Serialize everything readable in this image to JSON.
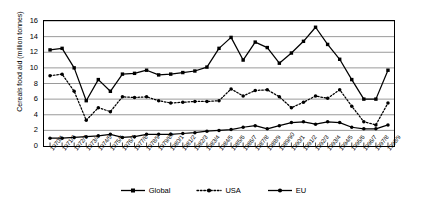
{
  "chart_data": {
    "type": "line",
    "title": "",
    "xlabel": "",
    "ylabel": "Cereals food aid (million tonnes)",
    "ylim": [
      0,
      16
    ],
    "yticks": [
      0,
      2,
      4,
      6,
      8,
      10,
      12,
      14,
      16
    ],
    "grid": true,
    "legend_position": "bottom",
    "categories": [
      "1970/1",
      "1971/2",
      "1972/3",
      "1973/4",
      "1974/5",
      "1975/6",
      "1976/7",
      "1977/8",
      "1978/9",
      "1979/80",
      "1980/1",
      "1981/2",
      "1982/3",
      "1983/4",
      "1984/5",
      "1985/6",
      "1986/7",
      "1987/8",
      "1988/9",
      "1989/90",
      "1990/1",
      "1991/2",
      "1992/3",
      "1993/4",
      "1994/5",
      "1995/6",
      "1996/7",
      "1997/8",
      "1998/9"
    ],
    "series": [
      {
        "name": "Global",
        "color": "#000000",
        "line_style": "solid",
        "marker": "square",
        "values": [
          12.3,
          12.5,
          10.0,
          5.8,
          8.5,
          7.0,
          9.2,
          9.3,
          9.7,
          9.1,
          9.2,
          9.4,
          9.6,
          10.1,
          12.5,
          13.9,
          11.0,
          13.3,
          12.6,
          10.6,
          11.9,
          13.4,
          15.2,
          13.0,
          11.1,
          8.5,
          6.0,
          6.0,
          9.7
        ]
      },
      {
        "name": "USA",
        "color": "#000000",
        "line_style": "dotted",
        "marker": "circle",
        "values": [
          9.0,
          9.2,
          7.0,
          3.3,
          4.9,
          4.4,
          6.3,
          6.2,
          6.3,
          5.8,
          5.5,
          5.6,
          5.7,
          5.7,
          5.8,
          7.3,
          6.4,
          7.1,
          7.2,
          6.3,
          4.9,
          5.6,
          6.4,
          6.1,
          7.2,
          5.1,
          3.1,
          2.7,
          5.5
        ]
      },
      {
        "name": "EU",
        "color": "#000000",
        "line_style": "solid",
        "marker": "circle",
        "values": [
          1.0,
          1.0,
          1.1,
          1.2,
          1.3,
          1.5,
          1.1,
          1.2,
          1.5,
          1.5,
          1.5,
          1.6,
          1.7,
          1.9,
          2.0,
          2.1,
          2.4,
          2.6,
          2.2,
          2.6,
          3.0,
          3.1,
          2.8,
          3.1,
          3.0,
          2.4,
          2.2,
          2.2,
          2.7
        ]
      }
    ]
  },
  "legend": {
    "items": [
      {
        "label": "Global"
      },
      {
        "label": "USA"
      },
      {
        "label": "EU"
      }
    ]
  }
}
